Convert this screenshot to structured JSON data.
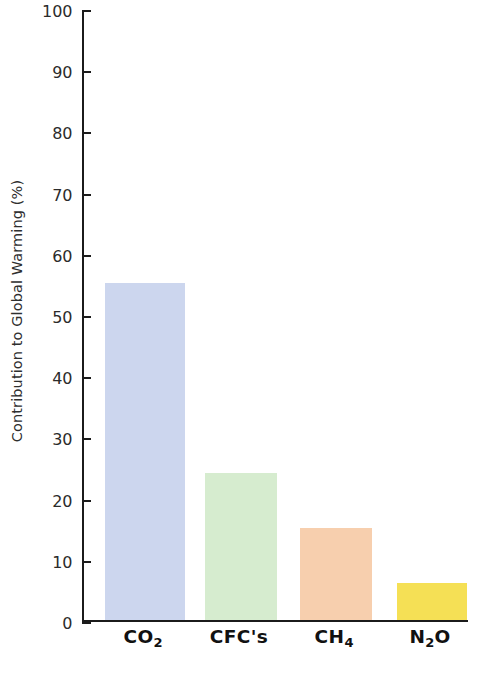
{
  "chart_data": {
    "type": "bar",
    "title": "",
    "subtitle": "",
    "xlabel": "",
    "ylabel": "Contribution to Global Warming (%)",
    "categories": [
      "CO2",
      "CFC's",
      "CH4",
      "N2O"
    ],
    "category_labels_html": [
      "CO<sub>2</sub>",
      "CFC's",
      "CH<sub>4</sub>",
      "N<sub>2</sub>O"
    ],
    "values": [
      55,
      24,
      15,
      6
    ],
    "ylim": [
      0,
      100
    ],
    "ytick_step": 10,
    "ytick_labels": [
      "0",
      "10",
      "20",
      "30",
      "40",
      "50",
      "60",
      "70",
      "80",
      "90",
      "100"
    ],
    "grid": false,
    "legend": false,
    "legend_position": "none",
    "bar_colors": [
      "#ccd6ee",
      "#d6eccf",
      "#f7cfae",
      "#f5e055"
    ],
    "axis_color": "#1b1b1b",
    "background_color": "#ffffff",
    "bars": [
      {
        "category": "CO2",
        "label_html": "CO<sub>2</sub>",
        "value": 55,
        "color": "#ccd6ee"
      },
      {
        "category": "CFC's",
        "label_html": "CFC's",
        "value": 24,
        "color": "#d6eccf"
      },
      {
        "category": "CH4",
        "label_html": "CH<sub>4</sub>",
        "value": 15,
        "color": "#f7cfae"
      },
      {
        "category": "N2O",
        "label_html": "N<sub>2</sub>O",
        "value": 6,
        "color": "#f5e055"
      }
    ]
  },
  "axis": {
    "y_title": "Contribution to Global Warming (%)"
  }
}
